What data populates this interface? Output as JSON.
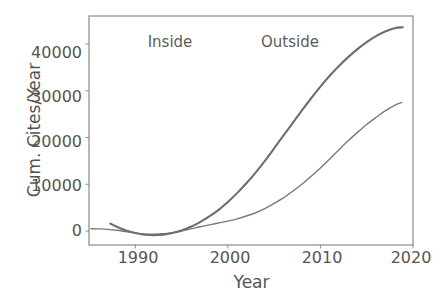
{
  "chart_data": {
    "type": "line",
    "title": "",
    "xlabel": "Year",
    "ylabel": "Cum. Cites/Year",
    "xlim": [
      1985.0,
      2020.0
    ],
    "ylim": [
      -3000,
      46000
    ],
    "xticks": [
      "1990",
      "2000",
      "2010",
      "2020"
    ],
    "xtick_values": [
      1990,
      2000,
      2010,
      2020
    ],
    "yticks": [
      "0",
      "10000",
      "20000",
      "30000",
      "40000"
    ],
    "ytick_values": [
      0,
      10000,
      20000,
      30000,
      40000
    ],
    "grid": false,
    "legend": "none",
    "annotations": [
      {
        "text": "Inside",
        "x": 1991.5,
        "y": 44000
      },
      {
        "text": "Outside",
        "x": 2004.0,
        "y": 44000
      }
    ],
    "series": [
      {
        "name": "Inside",
        "color": "#7a7a7a",
        "x": [
          1985.2,
          1986.0,
          1987.0,
          1988.0,
          1989.0,
          1990.0,
          1991.0,
          1992.0,
          1993.0,
          1994.0,
          1995.0,
          1996.0,
          1997.0,
          1998.0,
          1999.0,
          2000.0,
          2001.0,
          2002.0,
          2003.0,
          2004.0,
          2005.0,
          2006.0,
          2007.0,
          2008.0,
          2009.0,
          2010.0,
          2011.0,
          2012.0,
          2013.0,
          2014.0,
          2015.0,
          2016.0,
          2017.0,
          2018.0,
          2018.8
        ],
        "y": [
          500,
          450,
          350,
          150,
          -150,
          -450,
          -650,
          -700,
          -600,
          -350,
          0,
          450,
          900,
          1300,
          1700,
          2100,
          2600,
          3200,
          3900,
          4800,
          5900,
          7100,
          8500,
          10000,
          11700,
          13500,
          15400,
          17400,
          19300,
          21100,
          22800,
          24300,
          25700,
          26900,
          27500
        ]
      },
      {
        "name": "Outside",
        "color": "#6e6e6e",
        "x": [
          1987.3,
          1988.0,
          1989.0,
          1990.0,
          1991.0,
          1992.0,
          1993.0,
          1994.0,
          1995.0,
          1996.0,
          1997.0,
          1998.0,
          1999.0,
          2000.0,
          2001.0,
          2002.0,
          2003.0,
          2004.0,
          2005.0,
          2006.0,
          2007.0,
          2008.0,
          2009.0,
          2010.0,
          2011.0,
          2012.0,
          2013.0,
          2014.0,
          2015.0,
          2016.0,
          2017.0,
          2018.0,
          2018.9
        ],
        "y": [
          1600,
          900,
          100,
          -450,
          -800,
          -900,
          -800,
          -450,
          100,
          900,
          1900,
          3100,
          4500,
          6200,
          8100,
          10200,
          12500,
          15000,
          17700,
          20400,
          23100,
          25800,
          28400,
          30900,
          33200,
          35300,
          37200,
          38900,
          40400,
          41700,
          42700,
          43400,
          43600
        ]
      }
    ]
  },
  "figure": {
    "frame_color": "#8a8a8a",
    "text_color": "#555555"
  }
}
